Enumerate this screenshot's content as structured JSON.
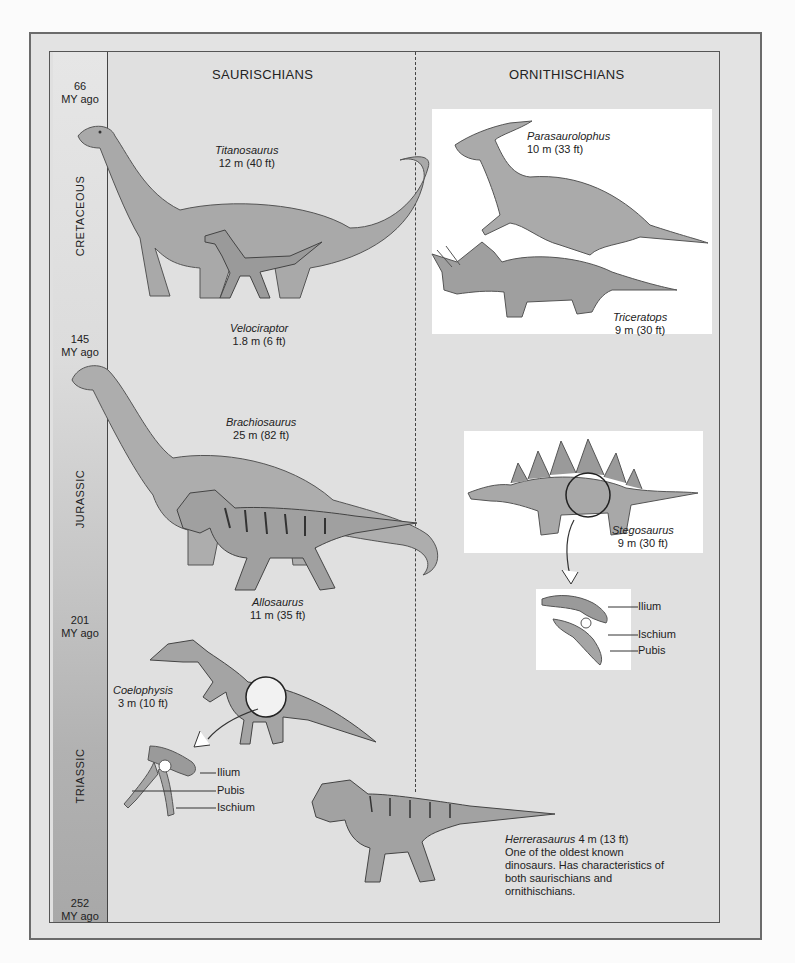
{
  "headings": {
    "left": "SAURISCHIANS",
    "right": "ORNITHISCHIANS"
  },
  "timeline": {
    "markers": [
      {
        "value": "66",
        "unit": "MY ago"
      },
      {
        "value": "145",
        "unit": "MY ago"
      },
      {
        "value": "201",
        "unit": "MY ago"
      },
      {
        "value": "252",
        "unit": "MY ago"
      }
    ],
    "periods": [
      "CRETACEOUS",
      "JURASSIC",
      "TRIASSIC"
    ]
  },
  "dinosaurs": {
    "titanosaurus": {
      "name": "Titanosaurus",
      "size": "12 m (40 ft)"
    },
    "velociraptor": {
      "name": "Velociraptor",
      "size": "1.8 m (6 ft)"
    },
    "parasaurolophus": {
      "name": "Parasaurolophus",
      "size": "10 m (33 ft)"
    },
    "triceratops": {
      "name": "Triceratops",
      "size": "9 m (30 ft)"
    },
    "brachiosaurus": {
      "name": "Brachiosaurus",
      "size": "25 m (82 ft)"
    },
    "allosaurus": {
      "name": "Allosaurus",
      "size": "11 m (35 ft)"
    },
    "stegosaurus": {
      "name": "Stegosaurus",
      "size": "9 m (30 ft)"
    },
    "coelophysis": {
      "name": "Coelophysis",
      "size": "3 m (10 ft)"
    },
    "herrerasaurus": {
      "name": "Herrerasaurus",
      "size": "4 m (13 ft)",
      "description": "One of the oldest known dinosaurs. Has characteristics of both saurischians and ornithischians."
    }
  },
  "hip_labels": {
    "ornithischian": [
      "Ilium",
      "Ischium",
      "Pubis"
    ],
    "saurischian": [
      "Ilium",
      "Pubis",
      "Ischium"
    ]
  },
  "colors": {
    "background": "#e0e0e0",
    "frame": "#6b6b6b",
    "panel": "#ffffff",
    "dino_fill": "#a9a9a9",
    "dino_stroke": "#555555"
  }
}
